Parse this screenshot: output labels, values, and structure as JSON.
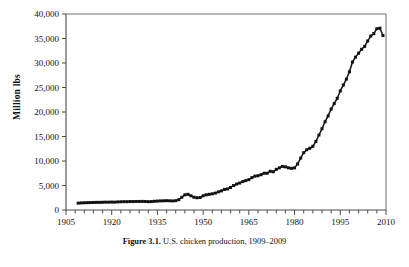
{
  "figure": {
    "caption_label": "Figure 3.1.",
    "caption_text": "U.S. chicken production, 1909–2009",
    "background_color": "#ffffff",
    "ink_color": "#111111"
  },
  "chart_data": {
    "type": "line",
    "title": "",
    "subtitle": "",
    "xlabel": "",
    "ylabel": "Million lbs",
    "xlim": [
      1905,
      2010
    ],
    "ylim": [
      0,
      40000
    ],
    "grid": false,
    "legend": "none",
    "marker": "square",
    "marker_color": "#111111",
    "line_color": "#111111",
    "x_major_ticks": [
      1905,
      1920,
      1935,
      1950,
      1965,
      1980,
      1995,
      2010
    ],
    "x_major_tick_labels": [
      "1905",
      "1920",
      "1935",
      "1950",
      "1965",
      "1980",
      "1995",
      "2010"
    ],
    "x_minor_tick_step": 3,
    "y_ticks": [
      0,
      5000,
      10000,
      15000,
      20000,
      25000,
      30000,
      35000,
      40000
    ],
    "y_tick_labels": [
      "0",
      "5,000",
      "10,000",
      "15,000",
      "20,000",
      "25,000",
      "30,000",
      "35,000",
      "40,000"
    ],
    "series": [
      {
        "name": "U.S. chicken production",
        "x": [
          1909,
          1910,
          1911,
          1912,
          1913,
          1914,
          1915,
          1916,
          1917,
          1918,
          1919,
          1920,
          1921,
          1922,
          1923,
          1924,
          1925,
          1926,
          1927,
          1928,
          1929,
          1930,
          1931,
          1932,
          1933,
          1934,
          1935,
          1936,
          1937,
          1938,
          1939,
          1940,
          1941,
          1942,
          1943,
          1944,
          1945,
          1946,
          1947,
          1948,
          1949,
          1950,
          1951,
          1952,
          1953,
          1954,
          1955,
          1956,
          1957,
          1958,
          1959,
          1960,
          1961,
          1962,
          1963,
          1964,
          1965,
          1966,
          1967,
          1968,
          1969,
          1970,
          1971,
          1972,
          1973,
          1974,
          1975,
          1976,
          1977,
          1978,
          1979,
          1980,
          1981,
          1982,
          1983,
          1984,
          1985,
          1986,
          1987,
          1988,
          1989,
          1990,
          1991,
          1992,
          1993,
          1994,
          1995,
          1996,
          1997,
          1998,
          1999,
          2000,
          2001,
          2002,
          2003,
          2004,
          2005,
          2006,
          2007,
          2008,
          2009
        ],
        "values": [
          1400,
          1450,
          1480,
          1500,
          1520,
          1540,
          1560,
          1560,
          1580,
          1600,
          1600,
          1620,
          1600,
          1650,
          1680,
          1700,
          1700,
          1720,
          1720,
          1740,
          1750,
          1760,
          1740,
          1700,
          1720,
          1780,
          1820,
          1860,
          1880,
          1900,
          1880,
          1860,
          1900,
          2100,
          2600,
          3100,
          3200,
          2900,
          2600,
          2500,
          2550,
          2900,
          3100,
          3200,
          3300,
          3450,
          3700,
          3900,
          4200,
          4300,
          4600,
          5000,
          5300,
          5500,
          5800,
          6000,
          6200,
          6600,
          6900,
          7000,
          7200,
          7500,
          7500,
          7900,
          7800,
          8300,
          8600,
          8900,
          8800,
          8600,
          8500,
          8600,
          9400,
          10600,
          11700,
          12300,
          12600,
          13000,
          14000,
          15300,
          16600,
          18000,
          19200,
          20600,
          21700,
          22800,
          24300,
          25500,
          26700,
          28200,
          30200,
          31200,
          32000,
          32800,
          33400,
          34500,
          35500,
          36000,
          37000,
          37100,
          35600
        ]
      }
    ],
    "annotations": []
  }
}
